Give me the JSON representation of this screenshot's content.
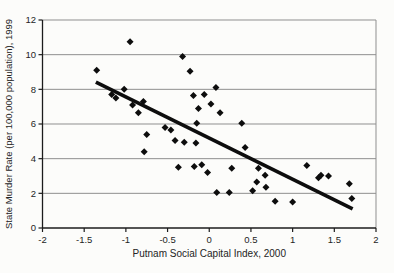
{
  "figure": {
    "background": "#fcfcfa",
    "grid_color": "#8f8f8f",
    "axis_color": "#1c1c1c",
    "marker_color": "#0d0d0d",
    "trend_color": "#0d0d0d",
    "tick_label_color": "#242424"
  },
  "chart_data": {
    "type": "scatter",
    "title": "",
    "xlabel": "Putnam Social Capital Index, 2000",
    "ylabel": "State Murder Rate (per 100,000 population), 1999",
    "xlim": [
      -2,
      2
    ],
    "ylim": [
      0,
      12
    ],
    "x_ticks": [
      -2,
      -1.5,
      -1,
      -0.5,
      0,
      0.5,
      1,
      1.5,
      2
    ],
    "x_tick_labels": [
      "-2",
      "-1.5",
      "-1",
      "-0.5",
      "0",
      "0.5",
      "1",
      "1.5",
      "2"
    ],
    "y_ticks": [
      0,
      2,
      4,
      6,
      8,
      10,
      12
    ],
    "y_tick_labels": [
      "0",
      "2",
      "4",
      "6",
      "8",
      "10",
      "12"
    ],
    "grid": "horizontal",
    "legend": null,
    "marker": "diamond",
    "points": [
      [
        -1.35,
        9.1
      ],
      [
        -0.95,
        10.75
      ],
      [
        -1.17,
        7.7
      ],
      [
        -1.12,
        7.5
      ],
      [
        -1.02,
        8.0
      ],
      [
        -0.92,
        7.1
      ],
      [
        -0.79,
        7.3
      ],
      [
        -0.85,
        6.65
      ],
      [
        -0.75,
        5.4
      ],
      [
        -0.78,
        4.4
      ],
      [
        -0.32,
        9.9
      ],
      [
        -0.23,
        9.05
      ],
      [
        0.08,
        8.1
      ],
      [
        -0.19,
        7.65
      ],
      [
        -0.06,
        7.7
      ],
      [
        0.02,
        7.15
      ],
      [
        -0.13,
        6.9
      ],
      [
        0.13,
        6.65
      ],
      [
        -0.15,
        6.05
      ],
      [
        0.39,
        6.05
      ],
      [
        -0.53,
        5.8
      ],
      [
        -0.46,
        5.65
      ],
      [
        -0.41,
        5.05
      ],
      [
        -0.3,
        4.95
      ],
      [
        -0.16,
        4.9
      ],
      [
        0.43,
        4.65
      ],
      [
        -0.37,
        3.5
      ],
      [
        -0.18,
        3.55
      ],
      [
        -0.09,
        3.65
      ],
      [
        -0.02,
        3.2
      ],
      [
        0.27,
        3.45
      ],
      [
        0.09,
        2.05
      ],
      [
        0.24,
        2.05
      ],
      [
        0.52,
        2.15
      ],
      [
        0.57,
        2.65
      ],
      [
        0.59,
        3.45
      ],
      [
        0.67,
        3.05
      ],
      [
        0.68,
        2.35
      ],
      [
        0.79,
        1.55
      ],
      [
        1.0,
        1.5
      ],
      [
        1.17,
        3.6
      ],
      [
        1.31,
        2.9
      ],
      [
        1.34,
        3.05
      ],
      [
        1.43,
        3.0
      ],
      [
        1.68,
        2.55
      ],
      [
        1.71,
        1.7
      ]
    ],
    "trend_line": {
      "x1": -1.36,
      "y1": 8.42,
      "x2": 1.72,
      "y2": 1.1
    }
  }
}
